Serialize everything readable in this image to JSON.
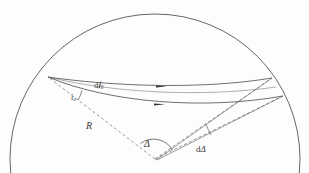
{
  "figure": {
    "background_color": "#fdfdfd",
    "line_color": "#4a4a4a",
    "dash_color": "#6e6e6e",
    "text_color": "#3a3a3a"
  },
  "labels": {
    "takeoff_angle": "i",
    "takeoff_angle_sub": "0",
    "takeoff_angle_increment_d": "d",
    "takeoff_angle_increment": "i",
    "takeoff_angle_increment_sub": "0",
    "radius": "R",
    "epicentral_distance": "Δ",
    "epicentral_distance_increment_d": "d",
    "epicentral_distance_increment": "Δ"
  },
  "geometry": {
    "earth_circle": {
      "center_x": 155,
      "center_y": 159,
      "radius": 145
    },
    "source_point": {
      "x": 48,
      "y": 77
    },
    "center_point": {
      "x": 155,
      "y": 159
    },
    "receiver_point_upper": {
      "x": 272,
      "y": 78
    },
    "receiver_point_lower": {
      "x": 283,
      "y": 96
    },
    "ray_arrow_upper": {
      "x": 162,
      "y": 86
    },
    "ray_arrow_lower": {
      "x": 160,
      "y": 104
    },
    "angle_arc_delta_radius": 22,
    "angle_arc_i0_radius": 34
  }
}
